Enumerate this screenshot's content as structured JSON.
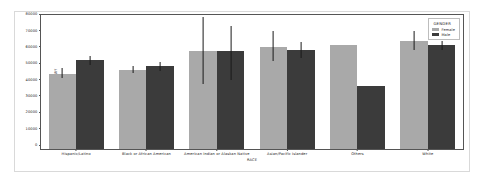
{
  "chart_data": {
    "type": "bar",
    "title": "",
    "xlabel": "RACE",
    "ylabel": "BASE_SALARY",
    "ylim": [
      0,
      82000
    ],
    "yticks": [
      0,
      10000,
      20000,
      30000,
      40000,
      50000,
      60000,
      70000,
      80000
    ],
    "ytick_labels": [
      "0",
      "10000",
      "20000",
      "30000",
      "40000",
      "50000",
      "60000",
      "70000",
      "80000"
    ],
    "grid": false,
    "legend": {
      "title": "GENDER",
      "position": "upper right",
      "entries": [
        {
          "label": "Female",
          "color": "#a9a9a9"
        },
        {
          "label": "Male",
          "color": "#3b3b3b"
        }
      ]
    },
    "categories": [
      "Hispanic/Latino",
      "Black or African American",
      "American Indian or Alaskan Native",
      "Asian/Pacific Islander",
      "Others",
      "White"
    ],
    "series": [
      {
        "name": "Female",
        "color": "#a9a9a9",
        "values": [
          46000,
          48500,
          60000,
          62500,
          63500,
          66000
        ],
        "err_low": [
          43500,
          46500,
          40000,
          54000,
          63500,
          60500
        ],
        "err_high": [
          49500,
          51000,
          80500,
          72500,
          63500,
          72000
        ]
      },
      {
        "name": "Male",
        "color": "#3b3b3b",
        "values": [
          54500,
          50500,
          60000,
          60500,
          38500,
          63500
        ],
        "err_low": [
          51500,
          47500,
          42500,
          55500,
          38500,
          60500
        ],
        "err_high": [
          57000,
          53000,
          75500,
          65500,
          38500,
          66000
        ]
      }
    ]
  }
}
